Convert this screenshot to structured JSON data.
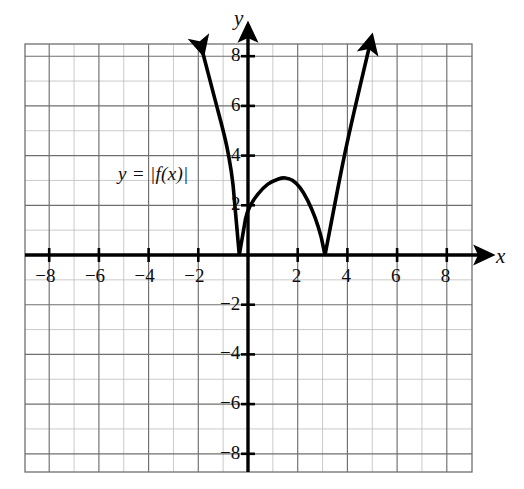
{
  "chart_data": {
    "type": "line",
    "title": "",
    "xlabel": "x",
    "ylabel": "y",
    "xlim": [
      -9,
      9
    ],
    "ylim": [
      -9,
      9
    ],
    "grid": true,
    "grid_step": 1,
    "grid_major_step": 2,
    "legend": "none",
    "annotations": [
      {
        "text": "y = |f(x)|",
        "x": -3.4,
        "y": 2.9
      }
    ],
    "x_tick_labels": [
      "−8",
      "−6",
      "−4",
      "−2",
      "2",
      "4",
      "6",
      "8"
    ],
    "x_tick_values": [
      -8,
      -6,
      -4,
      -2,
      2,
      4,
      6,
      8
    ],
    "y_tick_labels": [
      "8",
      "6",
      "4",
      "2",
      "−2",
      "−4",
      "−6",
      "−8"
    ],
    "y_tick_values": [
      8,
      6,
      4,
      2,
      -2,
      -4,
      -6,
      -8
    ],
    "series": [
      {
        "name": "y = |f(x)|",
        "color": "#000000",
        "description": "Absolute value of a cubic: V-shaped zero at x = -0.35, local maximum ~3.1 at x = 1.5, V-shaped zero at x = 3.1, rising arrows at both ends",
        "roots": [
          -0.35,
          3.1
        ],
        "local_max": {
          "x": 1.5,
          "y": 3.1
        },
        "arrow_start": {
          "x": -1.9,
          "y": 8.45
        },
        "arrow_end": {
          "x": 4.9,
          "y": 8.45
        },
        "points": [
          {
            "x": -1.9,
            "y": 8.45
          },
          {
            "x": -1.6,
            "y": 7.3
          },
          {
            "x": -1.3,
            "y": 6.15
          },
          {
            "x": -1.0,
            "y": 5.0
          },
          {
            "x": -0.8,
            "y": 4.1
          },
          {
            "x": -0.6,
            "y": 2.8
          },
          {
            "x": -0.35,
            "y": 0.0
          },
          {
            "x": -0.1,
            "y": 1.45
          },
          {
            "x": 0.1,
            "y": 2.0
          },
          {
            "x": 0.4,
            "y": 2.45
          },
          {
            "x": 0.8,
            "y": 2.85
          },
          {
            "x": 1.2,
            "y": 3.05
          },
          {
            "x": 1.5,
            "y": 3.1
          },
          {
            "x": 1.8,
            "y": 3.0
          },
          {
            "x": 2.1,
            "y": 2.7
          },
          {
            "x": 2.4,
            "y": 2.2
          },
          {
            "x": 2.7,
            "y": 1.5
          },
          {
            "x": 2.95,
            "y": 0.7
          },
          {
            "x": 3.1,
            "y": 0.0
          },
          {
            "x": 3.35,
            "y": 1.3
          },
          {
            "x": 3.6,
            "y": 2.6
          },
          {
            "x": 3.9,
            "y": 4.1
          },
          {
            "x": 4.3,
            "y": 5.9
          },
          {
            "x": 4.9,
            "y": 8.45
          }
        ]
      }
    ],
    "colors": {
      "curve": "#000000",
      "axis": "#000000",
      "grid_minor": "#b8b8b8",
      "grid_major": "#6e6e6e",
      "background": "#ffffff",
      "text": "#0d0d0d"
    }
  },
  "axes": {
    "x_axis_name": "x",
    "y_axis_name": "y"
  },
  "curve_label": "y = |f(x)|",
  "x_ticks": [
    {
      "label": "−8",
      "value": -8
    },
    {
      "label": "−6",
      "value": -6
    },
    {
      "label": "−4",
      "value": -4
    },
    {
      "label": "−2",
      "value": -2
    },
    {
      "label": "2",
      "value": 2
    },
    {
      "label": "4",
      "value": 4
    },
    {
      "label": "6",
      "value": 6
    },
    {
      "label": "8",
      "value": 8
    }
  ],
  "y_ticks": [
    {
      "label": "8",
      "value": 8
    },
    {
      "label": "6",
      "value": 6
    },
    {
      "label": "4",
      "value": 4
    },
    {
      "label": "2",
      "value": 2
    },
    {
      "label": "−2",
      "value": -2
    },
    {
      "label": "−4",
      "value": -4
    },
    {
      "label": "−6",
      "value": -6
    },
    {
      "label": "−8",
      "value": -8
    }
  ]
}
